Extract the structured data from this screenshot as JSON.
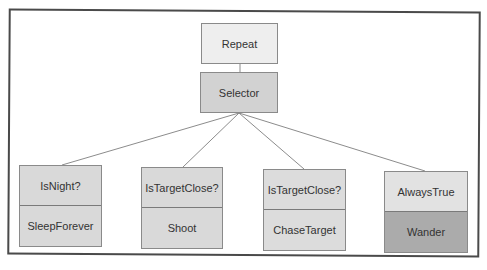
{
  "diagram": {
    "root": {
      "label": "Repeat",
      "color": "#eeeeee"
    },
    "selector": {
      "label": "Selector",
      "color": "#d2d2d2"
    },
    "branches": [
      {
        "condition": "IsNight?",
        "action": "SleepForever",
        "condition_color": "#d9d9d9",
        "action_color": "#d9d9d9"
      },
      {
        "condition": "IsTargetClose?",
        "action": "Shoot",
        "condition_color": "#d9d9d9",
        "action_color": "#d9d9d9"
      },
      {
        "condition": "IsTargetClose?",
        "action": "ChaseTarget",
        "condition_color": "#dcdcdc",
        "action_color": "#dcdcdc"
      },
      {
        "condition": "AlwaysTrue",
        "action": "Wander",
        "condition_color": "#e2e2e2",
        "action_color": "#ababab"
      }
    ],
    "line_color": "#8c8c8c",
    "frame_color": "#4a4a4a"
  }
}
